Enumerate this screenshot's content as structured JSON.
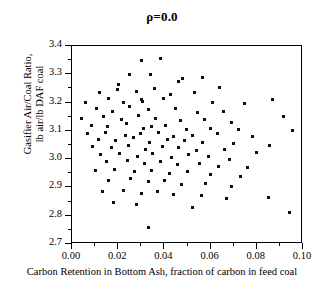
{
  "chart_data": {
    "type": "scatter",
    "title": "ρ=0.0",
    "xlabel": "Carbon Retention in Bottom Ash, fraction of carbon in feed coal",
    "ylabel_line1": "Gasifier Air/Coal Ratio,",
    "ylabel_line2": "lb air/lb DAF coal",
    "xlim": [
      0.0,
      0.1
    ],
    "ylim": [
      2.7,
      3.4
    ],
    "xticks": [
      "0.00",
      "0.02",
      "0.04",
      "0.06",
      "0.08",
      "0.10"
    ],
    "xtick_values": [
      0.0,
      0.02,
      0.04,
      0.06,
      0.08,
      0.1
    ],
    "xminor_values": [
      0.01,
      0.03,
      0.05,
      0.07,
      0.09
    ],
    "yticks": [
      "2.7",
      "2.8",
      "2.9",
      "3.0",
      "3.1",
      "3.2",
      "3.3",
      "3.4"
    ],
    "ytick_values": [
      2.7,
      2.8,
      2.9,
      3.0,
      3.1,
      3.2,
      3.3,
      3.4
    ],
    "yminor_values": [
      2.75,
      2.85,
      2.95,
      3.05,
      3.15,
      3.25,
      3.35
    ],
    "grid": false,
    "legend": null,
    "marker": "square",
    "marker_color": "#111111",
    "marker_size_px": 3,
    "n_points": 120,
    "points": [
      [
        0.03,
        3.35
      ],
      [
        0.0385,
        3.355
      ],
      [
        0.048,
        3.285
      ],
      [
        0.025,
        3.3
      ],
      [
        0.034,
        3.3
      ],
      [
        0.0565,
        3.29
      ],
      [
        0.02,
        3.265
      ],
      [
        0.046,
        3.275
      ],
      [
        0.064,
        3.255
      ],
      [
        0.012,
        3.235
      ],
      [
        0.0195,
        3.245
      ],
      [
        0.028,
        3.24
      ],
      [
        0.0355,
        3.25
      ],
      [
        0.0425,
        3.23
      ],
      [
        0.053,
        3.235
      ],
      [
        0.087,
        3.21
      ],
      [
        0.006,
        3.2
      ],
      [
        0.016,
        3.215
      ],
      [
        0.0225,
        3.2
      ],
      [
        0.03,
        3.21
      ],
      [
        0.0305,
        3.205
      ],
      [
        0.0395,
        3.215
      ],
      [
        0.061,
        3.2
      ],
      [
        0.0745,
        3.195
      ],
      [
        0.0105,
        3.18
      ],
      [
        0.0175,
        3.17
      ],
      [
        0.025,
        3.185
      ],
      [
        0.033,
        3.175
      ],
      [
        0.045,
        3.18
      ],
      [
        0.0545,
        3.165
      ],
      [
        0.0655,
        3.17
      ],
      [
        0.0915,
        3.15
      ],
      [
        0.004,
        3.145
      ],
      [
        0.0135,
        3.15
      ],
      [
        0.0215,
        3.14
      ],
      [
        0.029,
        3.155
      ],
      [
        0.036,
        3.145
      ],
      [
        0.047,
        3.135
      ],
      [
        0.0575,
        3.14
      ],
      [
        0.069,
        3.13
      ],
      [
        0.0085,
        3.12
      ],
      [
        0.0155,
        3.115
      ],
      [
        0.0235,
        3.125
      ],
      [
        0.031,
        3.11
      ],
      [
        0.0345,
        3.115
      ],
      [
        0.0405,
        3.12
      ],
      [
        0.0495,
        3.105
      ],
      [
        0.06,
        3.11
      ],
      [
        0.072,
        3.105
      ],
      [
        0.0955,
        3.1
      ],
      [
        0.0065,
        3.09
      ],
      [
        0.0145,
        3.095
      ],
      [
        0.023,
        3.085
      ],
      [
        0.0295,
        3.09
      ],
      [
        0.0375,
        3.095
      ],
      [
        0.044,
        3.08
      ],
      [
        0.052,
        3.085
      ],
      [
        0.063,
        3.09
      ],
      [
        0.078,
        3.08
      ],
      [
        0.0115,
        3.07
      ],
      [
        0.019,
        3.065
      ],
      [
        0.0265,
        3.075
      ],
      [
        0.0335,
        3.06
      ],
      [
        0.0415,
        3.07
      ],
      [
        0.0485,
        3.065
      ],
      [
        0.0565,
        3.06
      ],
      [
        0.07,
        3.055
      ],
      [
        0.0855,
        3.05
      ],
      [
        0.009,
        3.045
      ],
      [
        0.017,
        3.04
      ],
      [
        0.0245,
        3.05
      ],
      [
        0.032,
        3.035
      ],
      [
        0.039,
        3.045
      ],
      [
        0.046,
        3.04
      ],
      [
        0.054,
        3.03
      ],
      [
        0.066,
        3.035
      ],
      [
        0.08,
        3.025
      ],
      [
        0.0125,
        3.015
      ],
      [
        0.0205,
        3.02
      ],
      [
        0.0285,
        3.01
      ],
      [
        0.035,
        3.02
      ],
      [
        0.043,
        3.005
      ],
      [
        0.0505,
        3.015
      ],
      [
        0.059,
        3.01
      ],
      [
        0.068,
        3.0
      ],
      [
        0.015,
        2.99
      ],
      [
        0.024,
        2.995
      ],
      [
        0.0315,
        2.985
      ],
      [
        0.0385,
        2.99
      ],
      [
        0.0455,
        2.98
      ],
      [
        0.055,
        2.985
      ],
      [
        0.0635,
        2.975
      ],
      [
        0.076,
        2.97
      ],
      [
        0.01,
        2.96
      ],
      [
        0.0185,
        2.965
      ],
      [
        0.027,
        2.955
      ],
      [
        0.0345,
        2.96
      ],
      [
        0.042,
        2.95
      ],
      [
        0.05,
        2.955
      ],
      [
        0.06,
        2.945
      ],
      [
        0.073,
        2.94
      ],
      [
        0.016,
        2.925
      ],
      [
        0.0255,
        2.93
      ],
      [
        0.033,
        2.92
      ],
      [
        0.04,
        2.925
      ],
      [
        0.0475,
        2.91
      ],
      [
        0.058,
        2.915
      ],
      [
        0.069,
        2.905
      ],
      [
        0.013,
        2.885
      ],
      [
        0.0225,
        2.89
      ],
      [
        0.03,
        2.88
      ],
      [
        0.037,
        2.885
      ],
      [
        0.044,
        2.875
      ],
      [
        0.056,
        2.87
      ],
      [
        0.067,
        2.86
      ],
      [
        0.085,
        2.865
      ],
      [
        0.018,
        2.845
      ],
      [
        0.028,
        2.84
      ],
      [
        0.052,
        2.83
      ],
      [
        0.094,
        2.81
      ],
      [
        0.033,
        2.76
      ]
    ]
  }
}
